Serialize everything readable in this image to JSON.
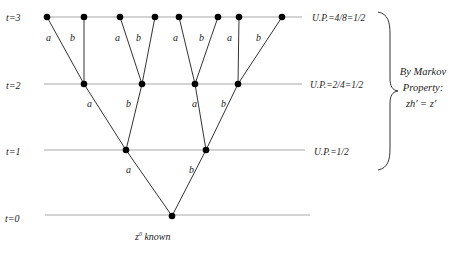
{
  "diagram": {
    "levels": [
      {
        "label": "t=3",
        "y": 17,
        "up": "U.P.=4/8=1/2"
      },
      {
        "label": "t=2",
        "y": 84,
        "up": "U.P.=2/4=1/2"
      },
      {
        "label": "t=1",
        "y": 150,
        "up": "U.P.=1/2"
      },
      {
        "label": "t=0",
        "y": 215,
        "up": ""
      }
    ],
    "root_label": "z",
    "root_sup": "0",
    "root_suffix": " known",
    "brace_text": {
      "line1": "By Markov",
      "line2": "Property:",
      "line3": "zh' = z'"
    },
    "edge_labels": {
      "t3_t2": [
        "a",
        "b",
        "a",
        "b",
        "a",
        "b",
        "a",
        "b"
      ],
      "t2_t1": [
        "a",
        "b",
        "a",
        "b"
      ],
      "t1_t0": [
        "a",
        "b"
      ]
    },
    "colors": {
      "line": "#a8a8a8",
      "edge": "#333333",
      "node": "#000000"
    }
  }
}
